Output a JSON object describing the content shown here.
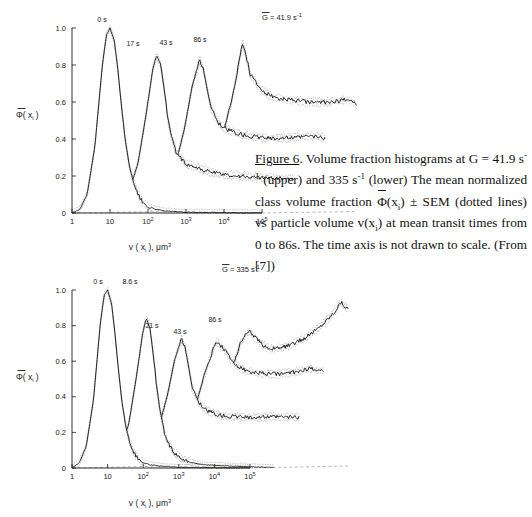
{
  "figure": {
    "caption_number": "Figure 6",
    "caption_part1": ". Volume fraction histograms at G = 41.9 s",
    "caption_sup1": "-1",
    "caption_part2": " (upper) and 335 s",
    "caption_sup2": "-1",
    "caption_part3": " (lower) The mean normalized class volume fraction ",
    "caption_phi": "Φ",
    "caption_phi_arg_open": "(x",
    "caption_phi_sub": "i",
    "caption_phi_arg_close": ")",
    "caption_part4": " ± SEM (dotted lines) vs particle volume v(x",
    "caption_sub_i": "i",
    "caption_part5": ") at mean transit times from 0 to 86s.  The time axis is not drawn to scale.  (From [7])",
    "line_color": "#1a1a1a",
    "sem_color": "#8c8c8c",
    "baseline_color": "#9a9a9a"
  },
  "upper": {
    "title_g": "G",
    "title_eq": " = 41.9 s",
    "title_sup": "-1",
    "ylabel_phi": "Φ",
    "ylabel_rest": "( x",
    "ylabel_sub": "i",
    "ylabel_close": " )",
    "xlabel_main": "v ( x",
    "xlabel_sub": "i",
    "xlabel_mid": " ),  μm",
    "xlabel_sup": "3",
    "yticks": [
      "0",
      "0.2",
      "0.4",
      "0.6",
      "0.8",
      "1.0"
    ],
    "xticks": [
      {
        "base": "1",
        "exp": ""
      },
      {
        "base": "10",
        "exp": ""
      },
      {
        "base": "10",
        "exp": "2"
      },
      {
        "base": "10",
        "exp": "3"
      },
      {
        "base": "10",
        "exp": "4"
      },
      {
        "base": "10",
        "exp": "5"
      }
    ],
    "curve_labels": [
      "0 s",
      "17 s",
      "43 s",
      "86 s"
    ]
  },
  "lower": {
    "title_g": "G",
    "title_eq": " = 335 s",
    "title_sup": "-1",
    "ylabel_phi": "Φ",
    "ylabel_rest": "( x",
    "ylabel_sub": "i",
    "ylabel_close": " )",
    "xlabel_main": "v ( x",
    "xlabel_sub": "i",
    "xlabel_mid": " ),  μm",
    "xlabel_sup": "3",
    "yticks": [
      "0",
      "0.2",
      "0.4",
      "0.6",
      "0.8",
      "1.0"
    ],
    "xticks": [
      {
        "base": "1",
        "exp": ""
      },
      {
        "base": "10",
        "exp": ""
      },
      {
        "base": "10",
        "exp": "2"
      },
      {
        "base": "10",
        "exp": "3"
      },
      {
        "base": "10",
        "exp": "4"
      },
      {
        "base": "10",
        "exp": "5"
      }
    ],
    "curve_labels": [
      "0 s",
      "8.6 s",
      "21 s",
      "43 s",
      "86 s"
    ]
  },
  "chart_data": {
    "type": "line",
    "xlabel": "v(x_i), µm^3",
    "ylabel": "Φ̄(x_i)",
    "xscale": "log",
    "xlim": [
      1,
      100000
    ],
    "ylim": [
      0,
      1.05
    ],
    "grid": false,
    "legend": "inline curve annotations",
    "panels": [
      {
        "name": "upper",
        "annotation": "Ḡ = 41.9 s⁻¹",
        "series": [
          {
            "name": "0 s",
            "offset_index": 0,
            "x": [
              1,
              1.6,
              2.5,
              4,
              6.3,
              8,
              10,
              13,
              16,
              20,
              25,
              32,
              40,
              50,
              63,
              80,
              100,
              160,
              250,
              400,
              1000,
              10000,
              100000
            ],
            "values": [
              0.0,
              0.02,
              0.1,
              0.36,
              0.8,
              0.96,
              1.0,
              0.93,
              0.78,
              0.58,
              0.4,
              0.26,
              0.18,
              0.12,
              0.08,
              0.05,
              0.035,
              0.02,
              0.012,
              0.008,
              0.004,
              0.002,
              0.0
            ]
          },
          {
            "name": "17 s",
            "offset_index": 1,
            "x": [
              1,
              2,
              4,
              8,
              13,
              20,
              25,
              32,
              40,
              50,
              63,
              80,
              100,
              160,
              250,
              400,
              630,
              1000,
              2500,
              10000,
              40000,
              100000
            ],
            "values": [
              0.0,
              0.02,
              0.08,
              0.26,
              0.52,
              0.78,
              0.85,
              0.8,
              0.66,
              0.5,
              0.4,
              0.33,
              0.3,
              0.26,
              0.25,
              0.23,
              0.22,
              0.21,
              0.2,
              0.19,
              0.185,
              0.18
            ]
          },
          {
            "name": "43 s",
            "offset_index": 2,
            "x": [
              1,
              2,
              5,
              10,
              20,
              32,
              50,
              63,
              80,
              100,
              160,
              250,
              400,
              630,
              1000,
              2500,
              6300,
              16000,
              40000,
              100000
            ],
            "values": [
              0.0,
              0.02,
              0.07,
              0.2,
              0.45,
              0.68,
              0.82,
              0.78,
              0.66,
              0.56,
              0.48,
              0.45,
              0.43,
              0.42,
              0.41,
              0.4,
              0.4,
              0.4,
              0.41,
              0.4
            ]
          },
          {
            "name": "86 s",
            "offset_index": 3,
            "x": [
              1,
              2,
              5,
              10,
              25,
              50,
              80,
              100,
              125,
              160,
              250,
              400,
              630,
              1000,
              2500,
              6300,
              16000,
              40000,
              63000,
              100000
            ],
            "values": [
              0.0,
              0.02,
              0.06,
              0.16,
              0.36,
              0.58,
              0.8,
              0.91,
              0.84,
              0.74,
              0.68,
              0.64,
              0.62,
              0.61,
              0.6,
              0.59,
              0.59,
              0.6,
              0.61,
              0.58
            ]
          }
        ]
      },
      {
        "name": "lower",
        "annotation": "Ḡ = 335 s⁻¹",
        "series": [
          {
            "name": "0 s",
            "offset_index": 0,
            "x": [
              1,
              1.6,
              2.5,
              4,
              6.3,
              8,
              10,
              13,
              16,
              20,
              25,
              32,
              40,
              50,
              63,
              80,
              100,
              160,
              250,
              400,
              1000,
              10000,
              100000
            ],
            "values": [
              0.0,
              0.03,
              0.12,
              0.38,
              0.82,
              0.97,
              1.0,
              0.92,
              0.76,
              0.56,
              0.38,
              0.24,
              0.16,
              0.1,
              0.07,
              0.045,
              0.03,
              0.018,
              0.012,
              0.008,
              0.004,
              0.002,
              0.0
            ]
          },
          {
            "name": "8.6 s",
            "offset_index": 1,
            "x": [
              1,
              2,
              4,
              8,
              13,
              20,
              25,
              32,
              40,
              50,
              63,
              80,
              100,
              160,
              250,
              400,
              1000,
              10000,
              100000
            ],
            "values": [
              0.0,
              0.02,
              0.07,
              0.24,
              0.5,
              0.76,
              0.84,
              0.78,
              0.62,
              0.44,
              0.3,
              0.2,
              0.14,
              0.08,
              0.05,
              0.03,
              0.015,
              0.006,
              0.0
            ]
          },
          {
            "name": "21 s",
            "offset_index": 2,
            "x": [
              1,
              2,
              5,
              10,
              20,
              32,
              50,
              63,
              80,
              100,
              160,
              250,
              400,
              630,
              1000,
              2500,
              10000,
              40000,
              100000
            ],
            "values": [
              0.0,
              0.02,
              0.06,
              0.18,
              0.4,
              0.6,
              0.72,
              0.68,
              0.56,
              0.44,
              0.36,
              0.32,
              0.3,
              0.29,
              0.285,
              0.28,
              0.28,
              0.28,
              0.28
            ]
          },
          {
            "name": "43 s",
            "offset_index": 3,
            "x": [
              1,
              2,
              5,
              10,
              25,
              50,
              80,
              100,
              160,
              250,
              400,
              630,
              1000,
              2500,
              6300,
              16000,
              40000,
              100000
            ],
            "values": [
              0.0,
              0.02,
              0.05,
              0.15,
              0.34,
              0.54,
              0.66,
              0.7,
              0.66,
              0.6,
              0.56,
              0.54,
              0.53,
              0.52,
              0.52,
              0.53,
              0.55,
              0.54
            ]
          },
          {
            "name": "86 s",
            "offset_index": 4,
            "x": [
              1,
              2,
              5,
              10,
              25,
              50,
              100,
              160,
              250,
              400,
              630,
              1000,
              2500,
              6300,
              16000,
              40000,
              63000,
              100000
            ],
            "values": [
              0.0,
              0.02,
              0.05,
              0.14,
              0.32,
              0.52,
              0.7,
              0.76,
              0.72,
              0.68,
              0.66,
              0.66,
              0.68,
              0.72,
              0.78,
              0.86,
              0.92,
              0.88
            ]
          }
        ]
      }
    ]
  }
}
